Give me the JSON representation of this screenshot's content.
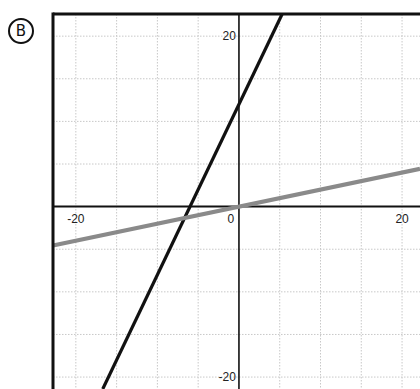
{
  "figure": {
    "label": "B"
  },
  "chart_data": {
    "type": "line",
    "title": "",
    "xlabel": "",
    "ylabel": "",
    "xlim": [
      -22.8,
      22.2
    ],
    "ylim": [
      -21.4,
      22.6
    ],
    "grid": true,
    "grid_step": 5,
    "x_ticks": [
      {
        "value": -20,
        "label": "-20"
      },
      {
        "value": 0,
        "label": "0"
      },
      {
        "value": 20,
        "label": "20"
      }
    ],
    "y_ticks": [
      {
        "value": 20,
        "label": "20"
      },
      {
        "value": -20,
        "label": "-20"
      }
    ],
    "series": [
      {
        "name": "black line",
        "equation": "y = 2x + 12",
        "color": "#111111",
        "x": [
          -16.7,
          5.3
        ],
        "y": [
          -21.4,
          22.6
        ]
      },
      {
        "name": "gray line",
        "equation": "y = 0.2x",
        "color": "#8a8a8a",
        "x": [
          -22.8,
          22.2
        ],
        "y": [
          -4.56,
          4.44
        ]
      }
    ],
    "legend": null
  }
}
